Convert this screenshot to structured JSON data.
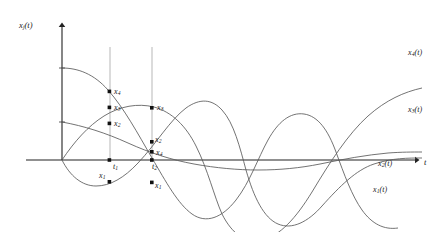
{
  "figure": {
    "type": "line-plot-diagram",
    "background": "#ffffff",
    "line_color": "#555555",
    "axis_color": "#222222",
    "marker_color": "#111111",
    "guide_color": "#8a8a8a",
    "width": 447,
    "height": 232
  },
  "axes": {
    "y_axis_label": "x",
    "y_axis_label_sub": "j",
    "y_axis_label_suffix": "(t)",
    "x_axis_label": "t",
    "origin_px": [
      62,
      160
    ],
    "x_axis_end_px": [
      422,
      160
    ],
    "y_axis_top_px": [
      62,
      22
    ]
  },
  "guides": [
    {
      "name": "t1",
      "label": "t",
      "sub": "1",
      "x_px": 110,
      "y_top_px": 47,
      "y_bottom_px": 160
    },
    {
      "name": "t2",
      "label": "t",
      "sub": "2",
      "x_px": 152,
      "y_top_px": 47,
      "y_bottom_px": 160
    }
  ],
  "curve_labels": [
    {
      "name": "x4",
      "base": "x",
      "sub": "4",
      "suffix": "(t)",
      "x_px": 408,
      "y_px": 52
    },
    {
      "name": "x3",
      "base": "x",
      "sub": "3",
      "suffix": "(t)",
      "x_px": 408,
      "y_px": 109
    },
    {
      "name": "x2",
      "base": "x",
      "sub": "2",
      "suffix": "(t)",
      "x_px": 378,
      "y_px": 162
    },
    {
      "name": "x1",
      "base": "x",
      "sub": "1",
      "suffix": "(t)",
      "x_px": 373,
      "y_px": 187
    }
  ],
  "sample_labels_t1": [
    {
      "name": "x4-t1",
      "base": "x",
      "sub": "4",
      "x_px": 114,
      "y_px": 94
    },
    {
      "name": "x3-t1",
      "base": "x",
      "sub": "3",
      "x_px": 114,
      "y_px": 110
    },
    {
      "name": "x2-t1",
      "base": "x",
      "sub": "2",
      "x_px": 114,
      "y_px": 126
    },
    {
      "name": "t1-tick",
      "base": "t",
      "sub": "1",
      "x_px": 114,
      "y_px": 164
    },
    {
      "name": "x1-t1",
      "base": "x",
      "sub": "1",
      "x_px": 101,
      "y_px": 173
    }
  ],
  "sample_labels_t2": [
    {
      "name": "x3-t2",
      "base": "x",
      "sub": "3",
      "x_px": 156,
      "y_px": 110
    },
    {
      "name": "x2-t2",
      "base": "x",
      "sub": "2",
      "x_px": 153,
      "y_px": 139
    },
    {
      "name": "x4-t2",
      "base": "x",
      "sub": "4",
      "x_px": 156,
      "y_px": 152
    },
    {
      "name": "t2-tick",
      "base": "t",
      "sub": "2",
      "x_px": 152,
      "y_px": 164
    },
    {
      "name": "x1-t2",
      "base": "x",
      "sub": "1",
      "x_px": 154,
      "y_px": 183
    }
  ],
  "chart_data": {
    "type": "line",
    "title": "",
    "xlabel": "t",
    "ylabel": "x_j(t)",
    "grid": false,
    "legend": "inline-curve-labels",
    "xlim": [
      0,
      1
    ],
    "ylim": [
      -1.15,
      1.15
    ],
    "sample_times": {
      "t1": 0.133,
      "t2": 0.25
    },
    "series": [
      {
        "name": "x_1(t)",
        "description": "starts at origin, dips negative, rises to positive hump mid-right, falls then rises near the end",
        "path_px": "M62,160 C70,176 82,186 96,186 C110,186 124,178 138,163 C156,144 170,120 186,108 C200,98 212,99 222,110 C234,123 240,148 246,170 C254,198 264,218 278,224 C292,230 308,222 322,206 C340,186 356,170 374,164 C392,158 408,158 422,158"
      },
      {
        "name": "x_2(t)",
        "description": "starts mid-height on y-axis, decays gently, shallow negative bowl, recovers toward axis at right",
        "path_px": "M62,122 C84,126 106,133 128,143 C150,153 172,160 194,164 C216,168 238,170 258,170 C280,170 300,168 320,164 C344,159 366,155 388,153 C402,152 412,152 422,152"
      },
      {
        "name": "x_3(t)",
        "description": "rises from origin to a broad hump, descends across the axis, deep trough, then rises steeply at the right",
        "path_px": "M62,160 C74,142 88,126 104,116 C120,106 138,103 154,107 C172,112 186,126 196,146 C208,170 214,196 222,214 C232,234 246,244 262,240 C280,236 296,218 312,192 C330,162 348,134 368,116 C386,100 404,92 422,88"
      },
      {
        "name": "x_4(t)",
        "description": "starts high on y-axis, falls through the axis, deep trough, large positive hump, falls again at the right",
        "path_px": "M62,68 C78,68 94,74 108,90 C124,108 138,134 152,158 C166,182 178,204 192,214 C206,224 222,218 236,200 C250,182 258,158 268,140 C278,122 290,112 304,114 C318,116 328,130 336,152 C344,174 352,196 362,210 C372,224 384,230 398,228"
      }
    ]
  }
}
